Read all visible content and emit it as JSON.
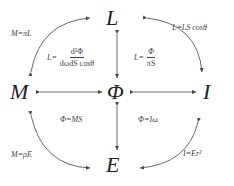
{
  "nodes": {
    "L": "L",
    "M": "M",
    "Phi": "Φ",
    "I": "I",
    "E": "E"
  },
  "relations": {
    "M_L": "M=πL",
    "L_I": "L=LS cosθ",
    "M_E": "M=ρE",
    "I_E": "I=Er²",
    "Phi_M": "Φ=MS",
    "Phi_I": "Φ=Iω",
    "L_def": {
      "lhs": "L=",
      "num": "d²Φ",
      "den": "dωdS cosθ"
    },
    "L_phi": {
      "lhs": "L=",
      "num": "Φ",
      "den": "πS"
    }
  },
  "colors": {
    "stroke": "#444444",
    "text": "#222222"
  }
}
